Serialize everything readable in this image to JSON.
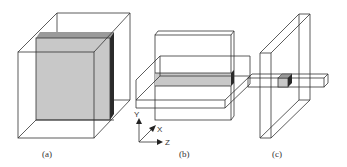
{
  "figure": {
    "panels": [
      {
        "id": "a",
        "label": "(a)",
        "description": "Transparent cube containing a large shaded vertical slab (full XY plane slice, thin in Z)"
      },
      {
        "id": "b",
        "label": "(b)",
        "description": "Thin vertical slab intersected by a horizontal slab; shaded intersection strip"
      },
      {
        "id": "c",
        "label": "(c)",
        "description": "Thin vertical plate intersected by a horizontal bar; shaded small cube at intersection"
      }
    ],
    "axes": {
      "y": "Y",
      "x": "X",
      "z": "Z"
    },
    "colors": {
      "line": "#333333",
      "shade": "#c8c8c8",
      "shade_dark": "#2a2a2a",
      "shade_top": "#9a9a9a"
    }
  }
}
